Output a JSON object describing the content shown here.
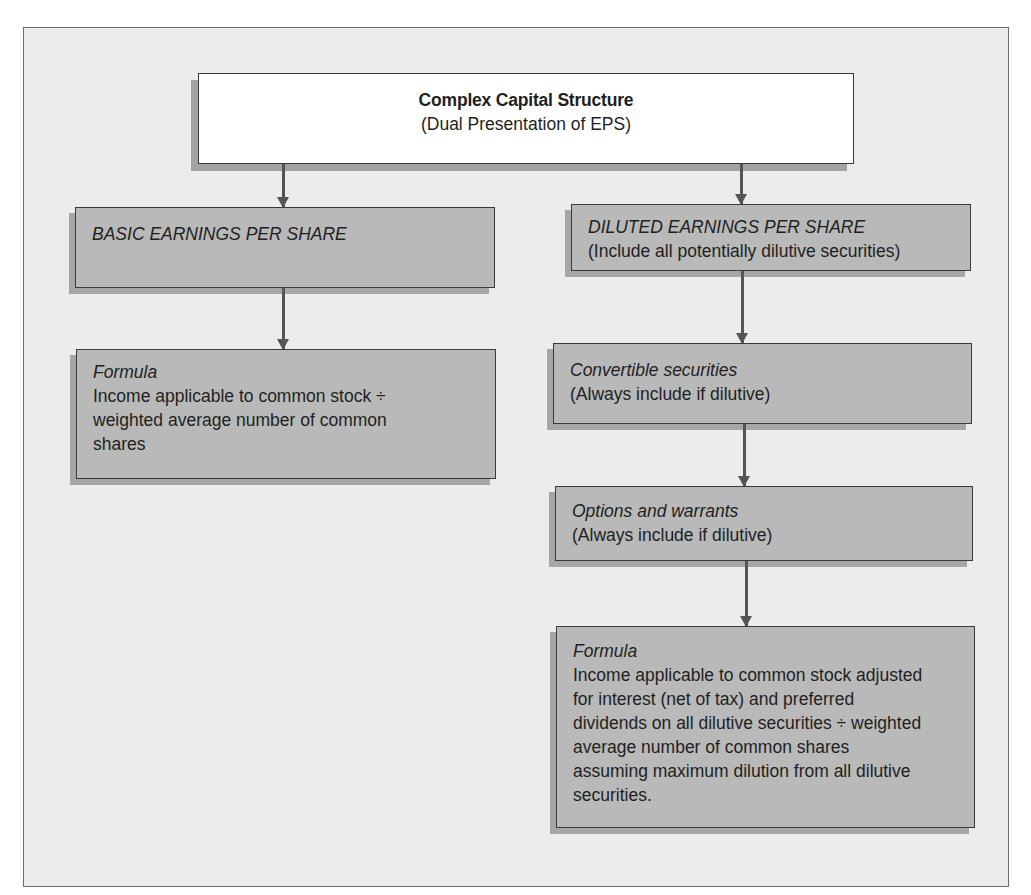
{
  "title_box": {
    "title": "Complex Capital Structure",
    "subtitle": "(Dual Presentation of EPS)"
  },
  "basic": {
    "heading": "BASIC EARNINGS PER SHARE",
    "formula_label": "Formula",
    "formula_text": "Income applicable to common stock ÷ weighted average number of common shares"
  },
  "diluted": {
    "heading": "DILUTED EARNINGS PER SHARE",
    "heading_note": "(Include all potentially dilutive securities)",
    "convertible_label": "Convertible securities",
    "convertible_note": "(Always include if dilutive)",
    "options_label": "Options and warrants",
    "options_note": "(Always include if dilutive)",
    "formula_label": "Formula",
    "formula_text": "Income applicable to common stock adjusted for interest (net of tax) and preferred dividends on all dilutive securities ÷ weighted average number of common shares assuming maximum dilution from all dilutive securities."
  },
  "colors": {
    "frame_bg": "#ececec",
    "box_fill": "#b9b9b9",
    "box_shadow": "#a6a6a6",
    "title_fill": "#ffffff",
    "border": "#3a3a3a",
    "arrow": "#555555"
  }
}
